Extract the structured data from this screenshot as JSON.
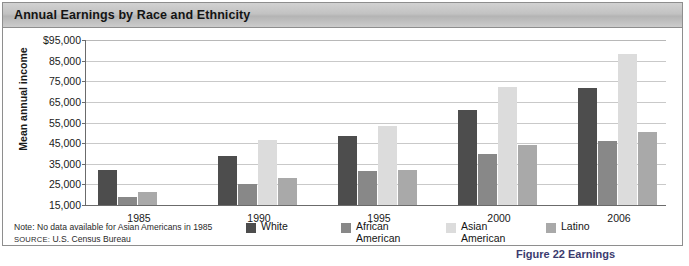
{
  "title": "Annual Earnings by Race and Ethnicity",
  "note": "Note: No data available for Asian Americans in 1985",
  "source_prefix": "SOURCE:",
  "source_text": "U.S. Census Bureau",
  "bottom_caption": "Figure 22  Earnings",
  "colors": {
    "white": "#4d4d4d",
    "african_american": "#888888",
    "asian_american": "#dcdcdc",
    "latino": "#a9a9a9",
    "gridline": "#c9c9c9",
    "axis": "#6b6b6b",
    "titlebar_top": "#d2d2d2",
    "titlebar_bottom": "#b4b4b4",
    "frame_border": "#8e8e8e"
  },
  "chart_data": {
    "type": "bar",
    "title": "Annual Earnings by Race and Ethnicity",
    "xlabel": "",
    "ylabel": "Mean annual income",
    "ylim": [
      15000,
      95000
    ],
    "ytick_values": [
      15000,
      25000,
      35000,
      45000,
      55000,
      65000,
      75000,
      85000,
      95000
    ],
    "ytick_labels": [
      "15,000",
      "25,000",
      "35,000",
      "45,000",
      "55,000",
      "65,000",
      "75,000",
      "85,000",
      "$95,000"
    ],
    "grid": true,
    "legend_position": "bottom",
    "categories": [
      "1985",
      "1990",
      "1995",
      "2000",
      "2006"
    ],
    "series": [
      {
        "name": "White",
        "color_key": "white",
        "values": [
          32000,
          39000,
          48500,
          61000,
          71500
        ]
      },
      {
        "name": "African\nAmerican",
        "legend_label": "African American",
        "color_key": "african_american",
        "values": [
          19000,
          25000,
          31500,
          39500,
          46000
        ]
      },
      {
        "name": "Asian\nAmerican",
        "legend_label": "Asian American",
        "color_key": "asian_american",
        "values": [
          null,
          46500,
          53500,
          72000,
          88000
        ]
      },
      {
        "name": "Latino",
        "color_key": "latino",
        "values": [
          21500,
          28000,
          32000,
          44000,
          50500
        ]
      }
    ],
    "annotations": [
      "Note: No data available for Asian Americans in 1985",
      "SOURCE: U.S. Census Bureau"
    ]
  }
}
